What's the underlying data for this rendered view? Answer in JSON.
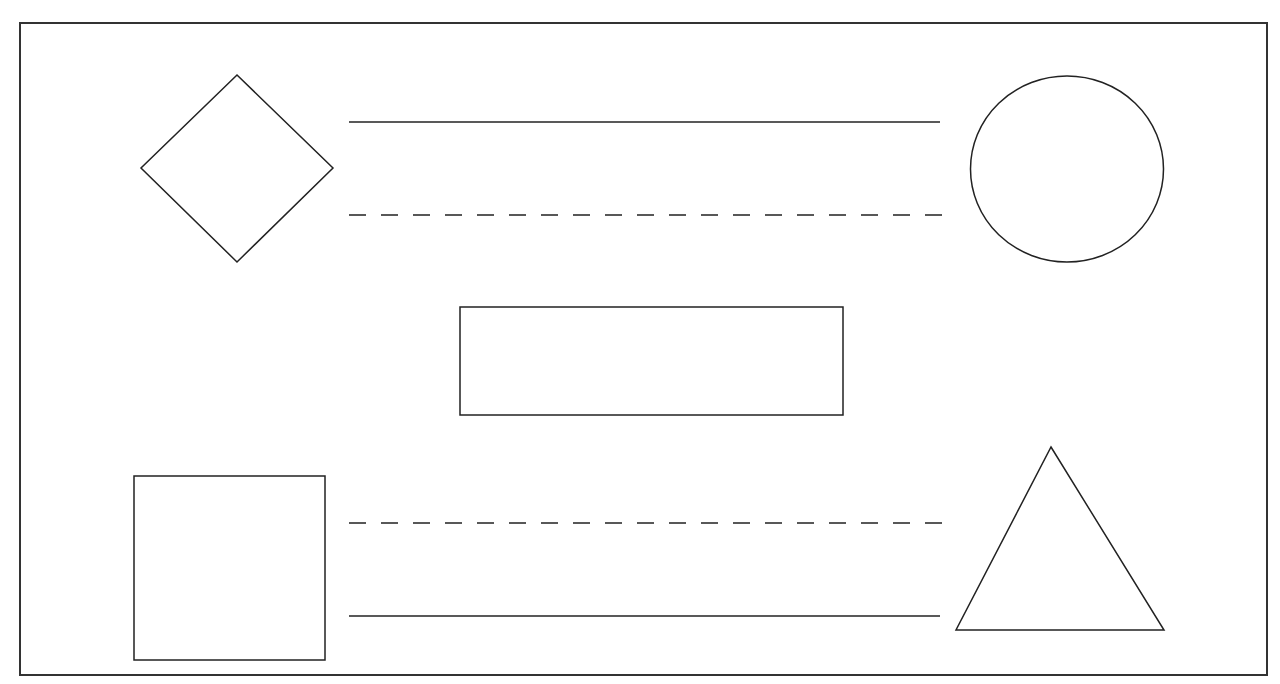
{
  "colors": {
    "background": "#ffffff",
    "stroke": "#222222",
    "frame": "#333333"
  },
  "frame": {
    "x": 20,
    "y": 23,
    "width": 1247,
    "height": 652
  },
  "shapes": {
    "diamond": {
      "top": [
        237,
        75
      ],
      "right": [
        333,
        168
      ],
      "bottom": [
        237,
        262
      ],
      "left": [
        141,
        168
      ]
    },
    "circle": {
      "cx": 1067,
      "cy": 169,
      "rx": 96.5,
      "ry": 93
    },
    "rectangle": {
      "x": 460,
      "y": 307,
      "width": 383,
      "height": 108
    },
    "square": {
      "x": 134,
      "y": 476,
      "width": 191,
      "height": 184
    },
    "triangle": {
      "apex": [
        1051,
        447
      ],
      "bottom_left": [
        956,
        630
      ],
      "bottom_right": [
        1164,
        630
      ]
    }
  },
  "lines": [
    {
      "name": "top-solid-line",
      "x1": 349,
      "y1": 122,
      "x2": 940,
      "y2": 122,
      "style": "solid"
    },
    {
      "name": "top-dashed-line",
      "x1": 349,
      "y1": 215,
      "x2": 942,
      "y2": 215,
      "style": "dashed"
    },
    {
      "name": "bottom-dashed-line",
      "x1": 349,
      "y1": 523,
      "x2": 942,
      "y2": 523,
      "style": "dashed"
    },
    {
      "name": "bottom-solid-line",
      "x1": 349,
      "y1": 616,
      "x2": 940,
      "y2": 616,
      "style": "solid"
    }
  ],
  "dash_pattern": "17 15"
}
